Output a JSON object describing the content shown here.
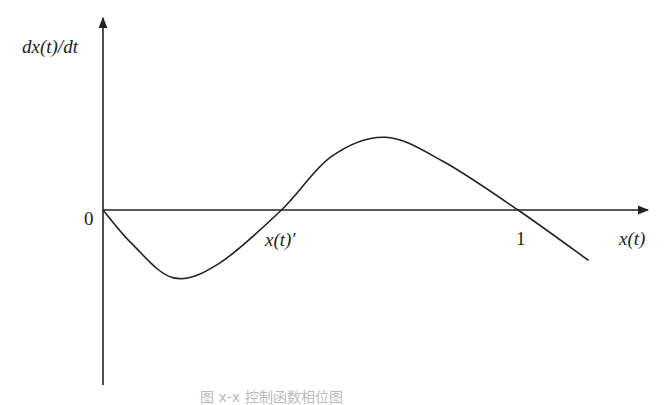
{
  "diagram": {
    "type": "phase-plot",
    "y_axis_label": "dx(t)/dt",
    "x_axis_label": "x(t)",
    "origin_label": "0",
    "markers": [
      {
        "label": "x(t)′",
        "x_value": 0.43
      },
      {
        "label": "1",
        "x_value": 1.0
      }
    ],
    "caption": "图 x-x 控制函数相位图",
    "curve": {
      "description": "Starts at origin, dips negative to a minimum, crosses zero at x(t)', rises to a positive maximum, crosses zero at 1, continues negative",
      "points": [
        {
          "x": 0.0,
          "y": 0.0
        },
        {
          "x": 0.07,
          "y": -0.35
        },
        {
          "x": 0.17,
          "y": -0.7
        },
        {
          "x": 0.28,
          "y": -0.55
        },
        {
          "x": 0.43,
          "y": 0.0
        },
        {
          "x": 0.55,
          "y": 0.55
        },
        {
          "x": 0.68,
          "y": 0.75
        },
        {
          "x": 0.82,
          "y": 0.5
        },
        {
          "x": 1.0,
          "y": 0.0
        },
        {
          "x": 1.17,
          "y": -0.52
        }
      ]
    }
  }
}
